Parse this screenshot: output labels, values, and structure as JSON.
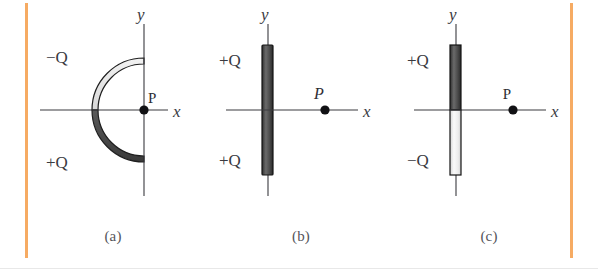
{
  "figure": {
    "caption_a": "(a)",
    "caption_b": "(b)",
    "caption_c": "(c)",
    "axis_x_label": "x",
    "axis_y_label": "y",
    "point_label": "P",
    "charge_positive": "+Q",
    "charge_negative": "−Q"
  },
  "colors": {
    "rule_orange": "#f5a65b",
    "ink": "#3a3a3f",
    "dark_fill": "#4a4a4a",
    "light_fill": "#e8e8e8",
    "outline": "#1a1a1a",
    "dot": "#111114",
    "caption_gray": "#54545a"
  },
  "panels": [
    {
      "id": "a",
      "caption": "(a)",
      "shape": "semicircular-ring",
      "opening": "left",
      "segments": [
        {
          "label": "−Q",
          "half": "upper",
          "fill": "light-gray"
        },
        {
          "label": "+Q",
          "half": "lower",
          "fill": "dark-gray"
        }
      ],
      "point": {
        "label": "P",
        "style": "roman",
        "location": "origin-on-y-axis"
      },
      "axes": {
        "x": "x",
        "y": "y"
      }
    },
    {
      "id": "b",
      "caption": "(b)",
      "shape": "vertical-rod",
      "segments": [
        {
          "label": "+Q",
          "half": "upper",
          "fill": "dark-gray"
        },
        {
          "label": "+Q",
          "half": "lower",
          "fill": "dark-gray"
        }
      ],
      "point": {
        "label": "P",
        "style": "italic",
        "location": "positive-x-axis"
      },
      "axes": {
        "x": "x",
        "y": "y"
      }
    },
    {
      "id": "c",
      "caption": "(c)",
      "shape": "vertical-rod",
      "segments": [
        {
          "label": "+Q",
          "half": "upper",
          "fill": "dark-gray"
        },
        {
          "label": "−Q",
          "half": "lower",
          "fill": "light-gray"
        }
      ],
      "point": {
        "label": "P",
        "style": "roman",
        "location": "positive-x-axis"
      },
      "axes": {
        "x": "x",
        "y": "y"
      }
    }
  ]
}
